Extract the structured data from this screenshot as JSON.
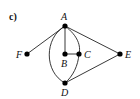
{
  "figure": {
    "panel_label": "c)"
  },
  "graph": {
    "nodes": [
      {
        "id": "A",
        "label": "A",
        "x": 65,
        "y": 26
      },
      {
        "id": "B",
        "label": "B",
        "x": 65,
        "y": 54
      },
      {
        "id": "C",
        "label": "C",
        "x": 79,
        "y": 54
      },
      {
        "id": "D",
        "label": "D",
        "x": 65,
        "y": 83
      },
      {
        "id": "E",
        "label": "E",
        "x": 120,
        "y": 54
      },
      {
        "id": "F",
        "label": "F",
        "x": 27,
        "y": 54
      }
    ],
    "edges": [
      {
        "from": "A",
        "to": "F",
        "type": "straight"
      },
      {
        "from": "A",
        "to": "E",
        "type": "straight"
      },
      {
        "from": "A",
        "to": "B",
        "type": "straight"
      },
      {
        "from": "B",
        "to": "C",
        "type": "straight"
      },
      {
        "from": "A",
        "to": "D",
        "type": "curve-left"
      },
      {
        "from": "A",
        "to": "D",
        "type": "curve-right-through-C"
      },
      {
        "from": "D",
        "to": "E",
        "type": "straight"
      }
    ]
  },
  "labels": {
    "A": "A",
    "B": "B",
    "C": "C",
    "D": "D",
    "E": "E",
    "F": "F"
  }
}
